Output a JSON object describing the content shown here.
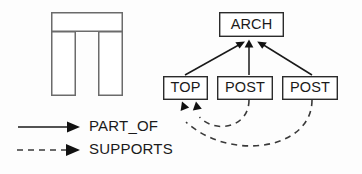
{
  "figure": {
    "background_color": "#fdfdfd",
    "line_color": "#1a1a1a",
    "box_stroke_color": "#2b2b2b",
    "shape_stroke_color": "#6b6b6b",
    "box_fill_color": "#ffffff"
  },
  "arch_picture": {
    "name": "arch-pictogram",
    "lintel": {
      "x": 51,
      "y": 12,
      "width": 72,
      "height": 20
    },
    "left_post": {
      "x": 51,
      "y": 32,
      "width": 25,
      "height": 64
    },
    "right_post": {
      "x": 98,
      "y": 32,
      "width": 25,
      "height": 64
    }
  },
  "graph": {
    "nodes": [
      {
        "id": "arch",
        "label": "ARCH",
        "x": 219,
        "y": 12,
        "width": 64,
        "height": 24
      },
      {
        "id": "top",
        "label": "TOP",
        "x": 163,
        "y": 76,
        "width": 44,
        "height": 23
      },
      {
        "id": "post_left",
        "label": "POST",
        "x": 217,
        "y": 76,
        "width": 55,
        "height": 23
      },
      {
        "id": "post_right",
        "label": "POST",
        "x": 282,
        "y": 76,
        "width": 55,
        "height": 23
      }
    ],
    "part_of_edges": [
      {
        "from": "top",
        "to": "arch",
        "relation": "PART_OF"
      },
      {
        "from": "post_left",
        "to": "arch",
        "relation": "PART_OF"
      },
      {
        "from": "post_right",
        "to": "arch",
        "relation": "PART_OF"
      }
    ],
    "supports_edges": [
      {
        "from": "post_left",
        "to": "top",
        "relation": "SUPPORTS"
      },
      {
        "from": "post_right",
        "to": "top",
        "relation": "SUPPORTS"
      }
    ]
  },
  "legend": {
    "name": "relation-legend",
    "items": [
      {
        "label": "PART_OF",
        "style": "solid",
        "y": 127
      },
      {
        "label": "SUPPORTS",
        "style": "dashed",
        "y": 150
      }
    ]
  }
}
